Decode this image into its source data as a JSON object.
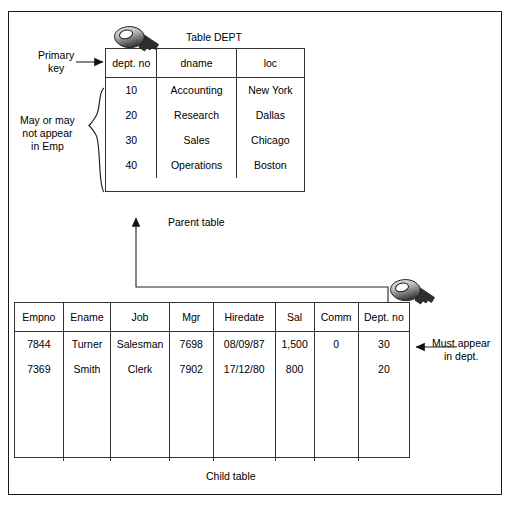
{
  "diagram": {
    "parent_caption": "Parent table",
    "child_caption": "Child table",
    "dept_title": "Table DEPT"
  },
  "annotations": {
    "primary_key": "Primary\nkey",
    "primary_key_line1": "Primary",
    "primary_key_line2": "key",
    "may_or_may_line1": "May or may",
    "may_or_may_line2": "not appear",
    "may_or_may_line3": "in Emp",
    "must_appear_line1": "Must appear",
    "must_appear_line2": "in dept."
  },
  "dept_table": {
    "name": "DEPT",
    "columns": [
      "dept. no",
      "dname",
      "loc"
    ],
    "rows": [
      [
        "10",
        "Accounting",
        "New York"
      ],
      [
        "20",
        "Research",
        "Dallas"
      ],
      [
        "30",
        "Sales",
        "Chicago"
      ],
      [
        "40",
        "Operations",
        "Boston"
      ]
    ]
  },
  "emp_table": {
    "name": "EMP",
    "columns": [
      "Empno",
      "Ename",
      "Job",
      "Mgr",
      "Hiredate",
      "Sal",
      "Comm",
      "Dept. no"
    ],
    "rows": [
      [
        "7844",
        "Turner",
        "Salesman",
        "7698",
        "08/09/87",
        "1,500",
        "0",
        "30"
      ],
      [
        "7369",
        "Smith",
        "Clerk",
        "7902",
        "17/12/80",
        "800",
        "",
        "20"
      ]
    ]
  },
  "icons": {
    "primary_key_icon": "key-icon",
    "foreign_key_icon": "key-icon"
  },
  "colors": {
    "border": "#333333",
    "frame": "#1a1a1a",
    "text": "#000000",
    "background": "#ffffff"
  }
}
